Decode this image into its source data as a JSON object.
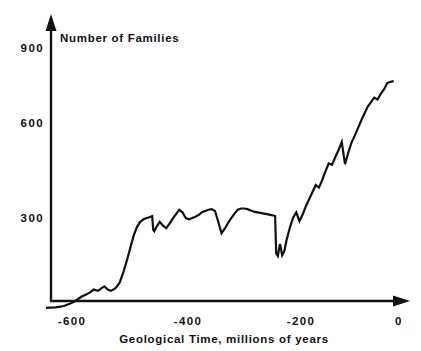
{
  "chart_data": {
    "type": "line",
    "title": "Number of Families",
    "xlabel": "Geological Time, millions of years",
    "ylabel": "Number of Families",
    "xlim": [
      -650,
      -5
    ],
    "ylim": [
      0,
      980
    ],
    "grid": false,
    "legend": null,
    "xticks": [
      -600,
      -400,
      -200,
      0
    ],
    "xtick_labels": [
      "-600",
      "-400",
      "-200",
      "0"
    ],
    "yticks": [
      300,
      600,
      900
    ],
    "ytick_labels": [
      "300",
      "600",
      "900"
    ],
    "series": [
      {
        "name": "Marine animal families",
        "x": [
          -648,
          -630,
          -615,
          -603,
          -594,
          -588,
          -582,
          -574,
          -566,
          -560,
          -552,
          -546,
          -540,
          -534,
          -528,
          -520,
          -512,
          -505,
          -498,
          -492,
          -486,
          -480,
          -474,
          -468,
          -462,
          -456,
          -452,
          -450,
          -448,
          -444,
          -438,
          -432,
          -426,
          -420,
          -414,
          -408,
          -402,
          -396,
          -390,
          -384,
          -378,
          -372,
          -366,
          -360,
          -354,
          -348,
          -342,
          -336,
          -330,
          -324,
          -318,
          -312,
          -306,
          -300,
          -294,
          -288,
          -282,
          -276,
          -270,
          -264,
          -258,
          -252,
          -246,
          -240,
          -234,
          -228,
          -225,
          -223,
          -220,
          -216,
          -212,
          -208,
          -204,
          -198,
          -192,
          -186,
          -180,
          -174,
          -168,
          -162,
          -156,
          -150,
          -144,
          -138,
          -132,
          -126,
          -120,
          -114,
          -108,
          -102,
          -96,
          -90,
          -84,
          -78,
          -72,
          -66,
          -60,
          -54,
          -48,
          -42,
          -36,
          -30,
          -24,
          -18,
          -12,
          -6
        ],
        "y": [
          16,
          18,
          22,
          30,
          38,
          45,
          52,
          58,
          66,
          74,
          70,
          78,
          84,
          74,
          70,
          78,
          96,
          130,
          170,
          208,
          245,
          272,
          288,
          296,
          300,
          303,
          306,
          262,
          258,
          272,
          288,
          276,
          268,
          282,
          298,
          312,
          326,
          318,
          300,
          296,
          300,
          304,
          310,
          318,
          322,
          326,
          328,
          322,
          288,
          252,
          266,
          284,
          300,
          314,
          326,
          330,
          330,
          328,
          324,
          320,
          318,
          316,
          314,
          312,
          310,
          308,
          306,
          188,
          180,
          218,
          182,
          196,
          230,
          268,
          300,
          318,
          290,
          312,
          338,
          360,
          382,
          404,
          396,
          420,
          448,
          472,
          468,
          492,
          514,
          540,
          470,
          506,
          538,
          560,
          584,
          608,
          630,
          652,
          666,
          680,
          674,
          692,
          706,
          726,
          730,
          732
        ]
      }
    ]
  },
  "axes": {
    "y_axis_name": "vertical-axis",
    "x_axis_name": "horizontal-axis",
    "arrow_up": "arrow-up-icon",
    "arrow_right": "arrow-right-icon"
  }
}
